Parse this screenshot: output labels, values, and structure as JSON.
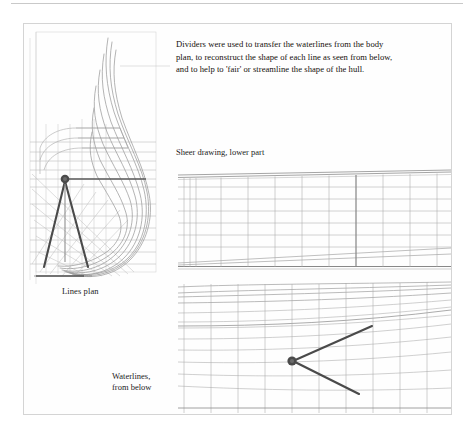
{
  "page": {
    "background_color": "#ffffff",
    "rule_color": "#c9c9c9",
    "frame_border_color": "#d4d4d4",
    "ink_color": "#15100c",
    "drawing_line_color": "#9a9a9a",
    "drawing_line_color_dark": "#6f6f6f",
    "divider_color": "#4a4a4a"
  },
  "caption": {
    "line1": "Dividers were used to transfer the waterlines from the body",
    "line2": "plan, to reconstruct the shape of each line as seen from below,",
    "line3": "and to help to 'fair' or streamline the shape of the hull."
  },
  "labels": {
    "lines_plan": "Lines plan",
    "sheer_drawing": "Sheer drawing, lower part",
    "waterlines_line1": "Waterlines,",
    "waterlines_line2": "from below"
  },
  "figures": {
    "lines_plan": {
      "name": "ship body plan half-section with dividers",
      "tool": "dividers"
    },
    "sheer_drawing": {
      "name": "sheer drawing lower part grid",
      "waterline_count": 7,
      "station_count": 11
    },
    "waterlines": {
      "name": "waterlines viewed from below with dividers",
      "waterline_count": 8,
      "station_count": 11,
      "tool": "dividers"
    }
  }
}
